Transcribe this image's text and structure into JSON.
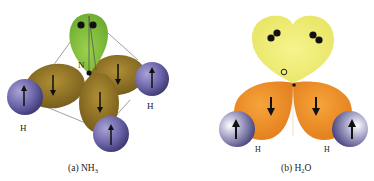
{
  "panels": [
    {
      "id": "a",
      "caption": "(a) NH",
      "caption_sub": "3",
      "central_atom": "N",
      "h_labels": [
        "H",
        "H"
      ],
      "lone_pair_count": 1,
      "bond_count": 3
    },
    {
      "id": "b",
      "caption": "(b) H",
      "caption_sub": "2",
      "caption_tail": "O",
      "central_atom": "O",
      "h_labels": [
        "H",
        "H"
      ],
      "lone_pair_count": 2,
      "bond_count": 2
    }
  ],
  "colors": {
    "lone_pair_nh3": "#8cc63f",
    "bond_lobe_nh3": "#8a6d1f",
    "lone_pair_h2o": "#f0ee7a",
    "bond_lobe_h2o": "#f0922a",
    "hydrogen": "#6b64a8",
    "electron": "#111111"
  }
}
